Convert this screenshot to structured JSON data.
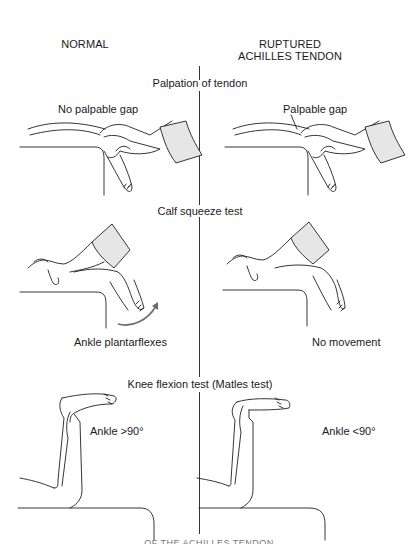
{
  "columns": {
    "left_header": "NORMAL",
    "right_header_line1": "RUPTURED",
    "right_header_line2": "ACHILLES TENDON"
  },
  "sections": [
    {
      "title": "Palpation of tendon",
      "normal_label": "No palpable gap",
      "ruptured_label": "Palpable gap"
    },
    {
      "title": "Calf squeeze test",
      "normal_label": "Ankle plantarflexes",
      "ruptured_label": "No movement"
    },
    {
      "title": "Knee flexion test (Matles test)",
      "normal_label": "Ankle >90°",
      "ruptured_label": "Ankle <90°"
    }
  ],
  "caption": "… OF THE ACHILLES TENDON …",
  "colors": {
    "ink": "#1f1f1f",
    "cuff_fill": "#e6e6e6",
    "arrow": "#6b6b6b"
  }
}
